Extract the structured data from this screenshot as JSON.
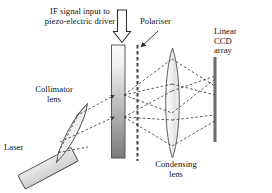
{
  "figure": {
    "type": "optical-schematic-diagram",
    "background_color": "#ffffff",
    "line_color": "#333333",
    "fill_gray_light": "#e8e8e8",
    "fill_gray_dark": "#8f8f8f"
  },
  "labels": {
    "if_signal": "IF signal input to\npiezo-electric driver",
    "polariser": "Polariser",
    "ccd": "Linear\nCCD\narray",
    "collimator": "Collimator\nlens",
    "laser": "Laser",
    "condensing": "Condensing\nlens"
  },
  "components": [
    {
      "name": "laser-source",
      "label": "Laser",
      "shape": "tilted-rectangle",
      "fill": "#dcdcdc"
    },
    {
      "name": "collimator-lens",
      "label": "Collimator lens",
      "shape": "tilted-thin-lens",
      "fill": "#f0f0f0"
    },
    {
      "name": "aotf-crystal",
      "label": "",
      "shape": "vertical-bar-gradient",
      "fill_top": "#f5f5f5",
      "fill_bottom": "#7d7d7d"
    },
    {
      "name": "polariser",
      "label": "Polariser",
      "shape": "vertical-dashed-line",
      "stroke": "#555555"
    },
    {
      "name": "condensing-lens",
      "label": "Condensing lens",
      "shape": "vertical-thin-lens",
      "fill": "#f2f2f2"
    },
    {
      "name": "linear-ccd-array",
      "label": "Linear CCD array",
      "shape": "vertical-thick-line",
      "stroke": "#6a6a6a"
    },
    {
      "name": "if-signal-arrow",
      "label": "IF signal input to piezo-electric driver",
      "shape": "hollow-block-arrow-down"
    }
  ],
  "ray_paths": {
    "style": "dashed",
    "description": "Laser beam diverges to collimator lens, collimated through AOTF crystal and polariser, then focused by condensing lens onto linear CCD array"
  }
}
